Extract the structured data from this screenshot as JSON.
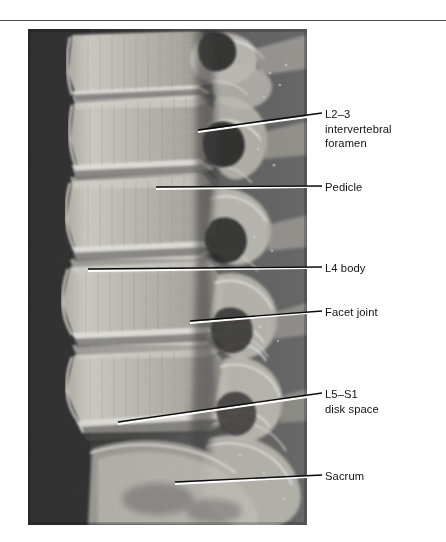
{
  "figure": {
    "kind": "radiograph",
    "modality": "X-ray",
    "view": "lateral",
    "region": "lumbar spine",
    "background_color": "#ffffff",
    "rule_color": "#4a4a4a"
  },
  "image_panel": {
    "name": "lumbar-spine-lateral-radiograph",
    "x": 28,
    "y": 29,
    "width": 279,
    "height": 496,
    "film_dark": "#262626",
    "bone_bright": "#f2f0ea",
    "soft_tissue": "#6e6e6e"
  },
  "annotations": [
    {
      "id": "l2-3-intervertebral-foramen",
      "text": "L2–3\nintervertebral\nforamen",
      "label_x": 325,
      "label_y": 107,
      "leader": {
        "x1": 198,
        "y1": 131,
        "x2": 322,
        "y2": 113
      }
    },
    {
      "id": "pedicle",
      "text": "Pedicle",
      "label_x": 325,
      "label_y": 180,
      "leader": {
        "x1": 156,
        "y1": 188,
        "x2": 322,
        "y2": 186
      }
    },
    {
      "id": "l4-body",
      "text": "L4 body",
      "label_x": 325,
      "label_y": 261,
      "leader": {
        "x1": 88,
        "y1": 270,
        "x2": 322,
        "y2": 267
      }
    },
    {
      "id": "facet-joint",
      "text": "Facet joint",
      "label_x": 325,
      "label_y": 305,
      "leader": {
        "x1": 190,
        "y1": 322,
        "x2": 322,
        "y2": 311
      }
    },
    {
      "id": "l5-s1-disk-space",
      "text": "L5–S1\ndisk space",
      "label_x": 325,
      "label_y": 387,
      "leader": {
        "x1": 118,
        "y1": 423,
        "x2": 322,
        "y2": 393
      }
    },
    {
      "id": "sacrum",
      "text": "Sacrum",
      "label_x": 325,
      "label_y": 469,
      "leader": {
        "x1": 175,
        "y1": 483,
        "x2": 322,
        "y2": 475
      }
    }
  ],
  "leader_style": {
    "outside_color": "#000000",
    "inside_color": "#ffffff",
    "width": 1.4
  }
}
